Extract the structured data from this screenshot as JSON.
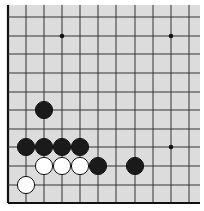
{
  "board": {
    "type": "go-board-corner-diagram",
    "corner": "bottom-left",
    "colors": {
      "background": "#dcdcdc",
      "line": "#333333",
      "edge": "#111111",
      "black": "#1a1a1a",
      "white": "#ffffff"
    },
    "columns_x": [
      8,
      26,
      44,
      62,
      80,
      98,
      116,
      135,
      153,
      171,
      189
    ],
    "rows_y": [
      203,
      185,
      166,
      147,
      129,
      110,
      92,
      73,
      54,
      36,
      17
    ],
    "star_points": [
      {
        "col": 3,
        "row": 9
      },
      {
        "col": 9,
        "row": 9
      },
      {
        "col": 9,
        "row": 3
      }
    ],
    "stones": [
      {
        "color": "white",
        "col": 1,
        "row": 1
      },
      {
        "color": "white",
        "col": 2,
        "row": 2
      },
      {
        "color": "white",
        "col": 3,
        "row": 2
      },
      {
        "color": "white",
        "col": 4,
        "row": 2
      },
      {
        "color": "black",
        "col": 5,
        "row": 2
      },
      {
        "color": "black",
        "col": 7,
        "row": 2
      },
      {
        "color": "black",
        "col": 1,
        "row": 3
      },
      {
        "color": "black",
        "col": 2,
        "row": 3
      },
      {
        "color": "black",
        "col": 3,
        "row": 3
      },
      {
        "color": "black",
        "col": 4,
        "row": 3
      },
      {
        "color": "black",
        "col": 2,
        "row": 5
      }
    ]
  }
}
